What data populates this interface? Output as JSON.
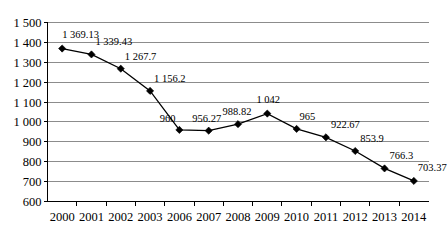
{
  "chart_data": {
    "type": "line",
    "title": "",
    "subtitle": "",
    "xlabel": "",
    "ylabel": "",
    "categories": [
      "2000",
      "2001",
      "2002",
      "2003",
      "2006",
      "2007",
      "2008",
      "2009",
      "2010",
      "2011",
      "2012",
      "2013",
      "2014"
    ],
    "values": [
      1369.13,
      1339.43,
      1267.7,
      1156.2,
      960,
      956.27,
      988.82,
      1042,
      965,
      922.67,
      853.9,
      766.3,
      703.37
    ],
    "point_labels": [
      "1 369.13",
      "1 339.43",
      "1 267.7",
      "1 156.2",
      "960",
      "956.27",
      "988.82",
      "1 042",
      "965",
      "922.67",
      "853.9",
      "766.3",
      "703.37"
    ],
    "ylim": [
      600,
      1500
    ],
    "ytick_values": [
      600,
      700,
      800,
      900,
      1000,
      1100,
      1200,
      1300,
      1400,
      1500
    ],
    "ytick_labels": [
      "600",
      "700",
      "800",
      "900",
      "1 000",
      "1 100",
      "1 200",
      "1 300",
      "1 400",
      "1 500"
    ],
    "grid": true,
    "grid_axis": "y",
    "legend": false,
    "legend_position": "none",
    "marker": "diamond",
    "series": [
      {
        "name": "",
        "values": [
          1369.13,
          1339.43,
          1267.7,
          1156.2,
          960,
          956.27,
          988.82,
          1042,
          965,
          922.67,
          853.9,
          766.3,
          703.37
        ]
      }
    ],
    "colors": {
      "line": "#000000",
      "marker": "#000000",
      "grid": "#8c8c8c",
      "axis": "#000000",
      "background": "#ffffff"
    },
    "label_offsets": [
      {
        "dx": 0,
        "dy": -11,
        "anchor": "start"
      },
      {
        "dx": 4,
        "dy": -9,
        "anchor": "start"
      },
      {
        "dx": 4,
        "dy": -9,
        "anchor": "start"
      },
      {
        "dx": 4,
        "dy": -9,
        "anchor": "start"
      },
      {
        "dx": -4,
        "dy": -8,
        "anchor": "end"
      },
      {
        "dx": -2,
        "dy": -9,
        "anchor": "middle"
      },
      {
        "dx": -1,
        "dy": -9,
        "anchor": "middle"
      },
      {
        "dx": 1,
        "dy": -11,
        "anchor": "middle"
      },
      {
        "dx": 3,
        "dy": -9,
        "anchor": "start"
      },
      {
        "dx": 5,
        "dy": -9,
        "anchor": "start"
      },
      {
        "dx": 5,
        "dy": -9,
        "anchor": "start"
      },
      {
        "dx": 5,
        "dy": -9,
        "anchor": "start"
      },
      {
        "dx": 4,
        "dy": -10,
        "anchor": "start"
      }
    ]
  }
}
